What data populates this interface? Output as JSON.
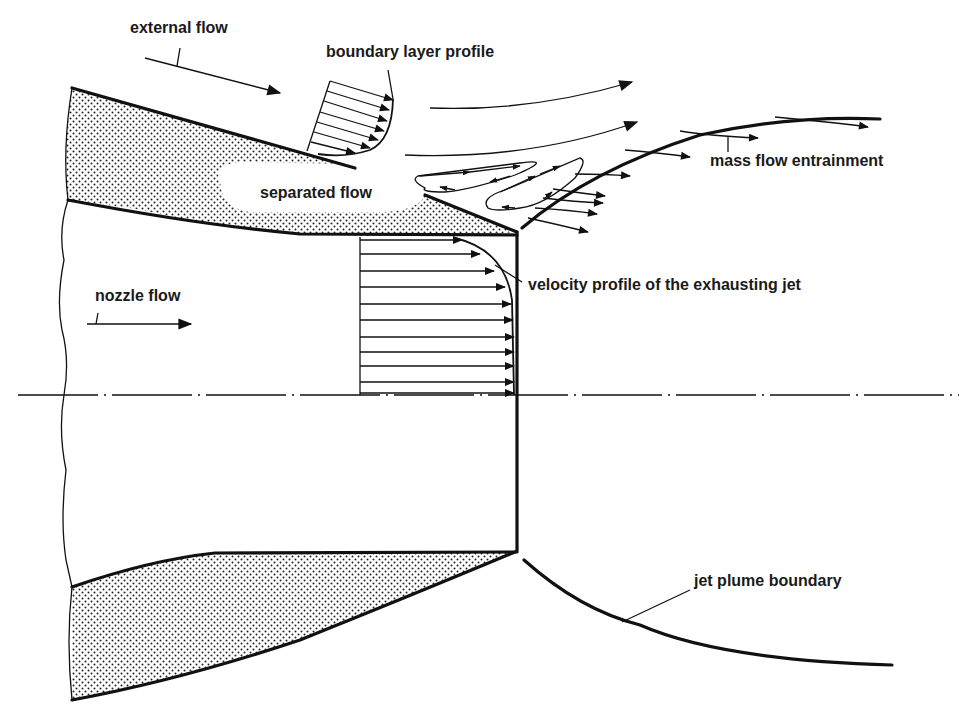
{
  "figure": {
    "colors": {
      "ink": "#111111",
      "background": "#ffffff",
      "stipple": "#222222"
    }
  },
  "labels": {
    "external_flow": "external flow",
    "boundary_layer_profile": "boundary layer profile",
    "separated_flow": "separated flow",
    "mass_flow_entrainment": "mass flow entrainment",
    "velocity_profile": "velocity profile of the exhausting jet",
    "nozzle_flow": "nozzle flow",
    "jet_plume_boundary": "jet plume boundary"
  }
}
